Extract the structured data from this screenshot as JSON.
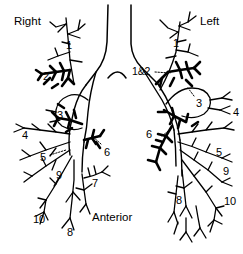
{
  "figure": {
    "type": "anatomical-diagram",
    "view": "anterior",
    "line_color": "#000000",
    "background_color": "#ffffff"
  },
  "orientation_labels": {
    "right": "Right",
    "left": "Left",
    "anterior": "Anterior"
  },
  "right_lung": {
    "name": "Right",
    "segments": [
      {
        "label": "1",
        "x": 66,
        "y": 40
      },
      {
        "label": "2",
        "x": 43,
        "y": 71
      },
      {
        "label": "3",
        "x": 57,
        "y": 110
      },
      {
        "label": "4",
        "x": 22,
        "y": 130
      },
      {
        "label": "5",
        "x": 40,
        "y": 152
      },
      {
        "label": "6",
        "x": 104,
        "y": 147
      },
      {
        "label": "7",
        "x": 92,
        "y": 178
      },
      {
        "label": "8",
        "x": 67,
        "y": 227
      },
      {
        "label": "9",
        "x": 56,
        "y": 170
      },
      {
        "label": "10",
        "x": 37,
        "y": 214
      }
    ]
  },
  "left_lung": {
    "name": "Left",
    "segments": [
      {
        "label": "1",
        "x": 173,
        "y": 38
      },
      {
        "label": "1&2",
        "x": 141,
        "y": 71
      },
      {
        "label": "3",
        "x": 196,
        "y": 98
      },
      {
        "label": "4",
        "x": 233,
        "y": 107
      },
      {
        "label": "5",
        "x": 216,
        "y": 147
      },
      {
        "label": "6",
        "x": 152,
        "y": 134
      },
      {
        "label": "8",
        "x": 176,
        "y": 202
      },
      {
        "label": "9",
        "x": 223,
        "y": 170
      },
      {
        "label": "10",
        "x": 226,
        "y": 202
      }
    ]
  }
}
